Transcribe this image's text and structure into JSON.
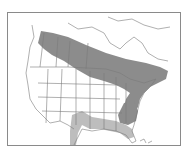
{
  "map": {
    "type": "range-map",
    "region": "North America",
    "colors": {
      "background": "#ffffff",
      "border": "#8a8a8a",
      "boundary_lines": "#7a7a7a",
      "range_primary": "#8c8c8c",
      "range_secondary": "#bdbdbd"
    },
    "legend": [],
    "ranges": [
      {
        "name": "primary-range",
        "shade": "dark",
        "description": "Band across southern Canada from the Rockies to the Maritimes, extending south through the northeastern US and the Appalachians"
      },
      {
        "name": "secondary-range",
        "shade": "light",
        "description": "Gulf coast band from southern Texas east to northern Florida"
      }
    ]
  }
}
